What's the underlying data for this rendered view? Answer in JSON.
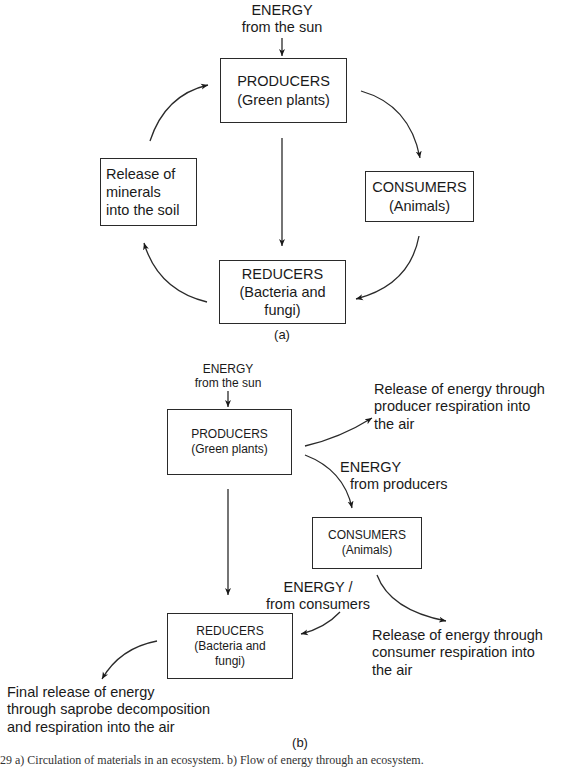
{
  "diagram_a": {
    "label": "(a)",
    "energy_input": {
      "line1": "ENERGY",
      "line2": "from the sun"
    },
    "producers": {
      "title": "PRODUCERS",
      "subtitle": "(Green plants)"
    },
    "consumers": {
      "title": "CONSUMERS",
      "subtitle": "(Animals)"
    },
    "reducers": {
      "title": "REDUCERS",
      "subtitle_line1": "(Bacteria and",
      "subtitle_line2": "fungi)"
    },
    "minerals": {
      "line1": "Release of",
      "line2": "minerals",
      "line3": "into the soil"
    }
  },
  "diagram_b": {
    "label": "(b)",
    "energy_input": {
      "line1": "ENERGY",
      "line2": "from the sun"
    },
    "producers": {
      "title": "PRODUCERS",
      "subtitle": "(Green plants)"
    },
    "consumers": {
      "title": "CONSUMERS",
      "subtitle": "(Animals)"
    },
    "reducers": {
      "title": "REDUCERS",
      "subtitle_line1": "(Bacteria and",
      "subtitle_line2": "fungi)"
    },
    "producer_release": {
      "line1": "Release of energy through",
      "line2": "producer respiration into",
      "line3": "the air"
    },
    "energy_from_producers": {
      "line1": "ENERGY",
      "line2": "from producers"
    },
    "energy_from_consumers": {
      "line1": "ENERGY /",
      "line2": "from consumers"
    },
    "consumer_release": {
      "line1": "Release of energy through",
      "line2": "consumer respiration into",
      "line3": "the air"
    },
    "final_release": {
      "line1": "Final release of energy",
      "line2": "through saprobe decomposition",
      "line3": "and respiration into the air"
    }
  },
  "caption": "29   a) Circulation of materials in an ecosystem. b) Flow of energy through an ecosystem."
}
